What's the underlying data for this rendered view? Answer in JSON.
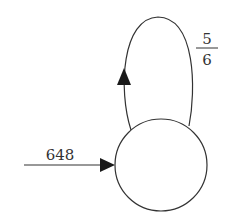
{
  "diagram": {
    "type": "state-loop",
    "input_arrow": {
      "label": "648"
    },
    "self_loop": {
      "numerator": "5",
      "denominator": "6"
    },
    "node": {
      "label": ""
    },
    "colors": {
      "stroke": "#333333",
      "arrowhead": "#1a1a1a",
      "background": "#ffffff"
    }
  }
}
